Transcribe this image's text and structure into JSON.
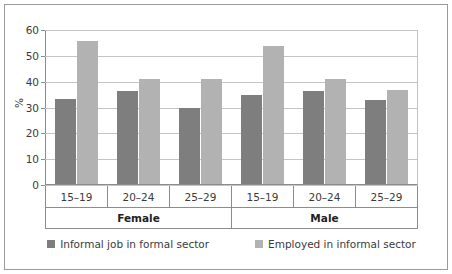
{
  "chart_data": {
    "type": "bar",
    "title": "",
    "xlabel": "",
    "ylabel": "%",
    "ylim": [
      0,
      60
    ],
    "ytick_values": [
      0,
      10,
      20,
      30,
      40,
      50,
      60
    ],
    "ytick_labels": [
      "0",
      "10",
      "20",
      "30",
      "40",
      "50",
      "60"
    ],
    "grid": true,
    "legend_position": "bottom",
    "categories": [
      "15–19",
      "20–24",
      "25–29",
      "15–19",
      "20–24",
      "25–29"
    ],
    "group_labels": [
      "Female",
      "Male"
    ],
    "groups": [
      {
        "label": "Female",
        "categories": [
          "15–19",
          "20–24",
          "25–29"
        ]
      },
      {
        "label": "Male",
        "categories": [
          "15–19",
          "20–24",
          "25–29"
        ]
      }
    ],
    "series": [
      {
        "name": "Informal job in formal sector",
        "color": "#7e7e7e",
        "values": [
          33.5,
          36.5,
          30.0,
          35.0,
          36.5,
          33.0
        ]
      },
      {
        "name": "Employed in informal sector",
        "color": "#b2b2b2",
        "values": [
          56.0,
          41.0,
          41.0,
          54.0,
          41.0,
          37.0
        ]
      }
    ],
    "bars": [
      {
        "group": "Female",
        "category": "15–19",
        "dark": 33.5,
        "light": 56.0
      },
      {
        "group": "Female",
        "category": "20–24",
        "dark": 36.5,
        "light": 41.0
      },
      {
        "group": "Female",
        "category": "25–29",
        "dark": 30.0,
        "light": 41.0
      },
      {
        "group": "Male",
        "category": "15–19",
        "dark": 35.0,
        "light": 54.0
      },
      {
        "group": "Male",
        "category": "20–24",
        "dark": 36.5,
        "light": 41.0
      },
      {
        "group": "Male",
        "category": "25–29",
        "dark": 33.0,
        "light": 37.0
      }
    ]
  },
  "legend": {
    "items": [
      {
        "label": "Informal job in formal sector",
        "color": "#7e7e7e"
      },
      {
        "label": "Employed in informal sector",
        "color": "#b2b2b2"
      }
    ]
  },
  "colors": {
    "series_dark": "#7e7e7e",
    "series_light": "#b2b2b2",
    "axis": "#8c8c8c",
    "grid": "#c4c4c4",
    "frame": "#9a9a9a",
    "background": "#ffffff",
    "text": "#3b3b3b"
  }
}
